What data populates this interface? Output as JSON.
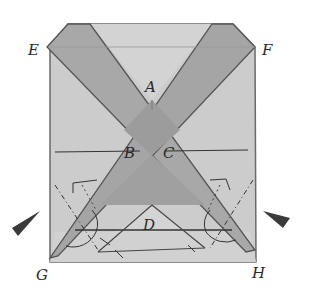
{
  "figure": {
    "type": "origami-folding-diagram",
    "colors": {
      "paper": "#c9c9c9",
      "paper_light": "#d6d6d6",
      "band": "#a9a9a9",
      "band_dark": "#9a9a9a",
      "line": "#4a4a4a",
      "arrow": "#3a3a3a"
    },
    "labels": {
      "E": "E",
      "F": "F",
      "A": "A",
      "B": "B",
      "C": "C",
      "D": "D",
      "G": "G",
      "H": "H"
    },
    "arrows": [
      {
        "side": "left",
        "direction": "inward"
      },
      {
        "side": "right",
        "direction": "inward"
      }
    ]
  }
}
